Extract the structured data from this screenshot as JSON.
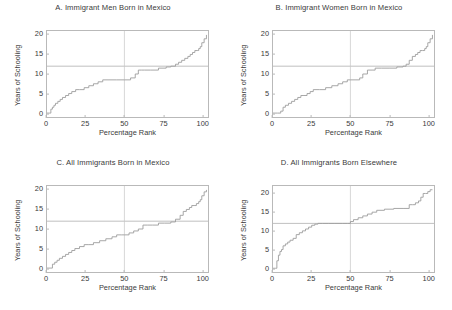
{
  "figure": {
    "background": "#ffffff",
    "line_color": "#9d9d9d",
    "axis_color": "#b9b9b9",
    "reference_line_color": "#b0b0b0"
  },
  "chart_data": [
    {
      "type": "line",
      "panel_letter": "A.",
      "title": "A.  Immigrant Men Born in Mexico",
      "xlabel": "Percentage Rank",
      "ylabel": "Years of Schooling",
      "xlim": [
        0,
        104
      ],
      "ylim": [
        -1,
        21
      ],
      "xticks": [
        0,
        25,
        50,
        75,
        100
      ],
      "yticks": [
        0,
        5,
        10,
        15,
        20
      ],
      "grid": false,
      "reference_lines": [
        {
          "orientation": "horizontal",
          "y": 12,
          "label": "12 years of schooling"
        },
        {
          "orientation": "vertical",
          "x": 50,
          "label": "median rank"
        }
      ],
      "series": [
        {
          "name": "Years of schooling by percentage rank",
          "step": "post",
          "x": [
            0,
            1.5,
            2.5,
            3.5,
            4.5,
            5.5,
            7,
            8.5,
            10,
            12,
            14,
            16,
            18.5,
            21,
            24,
            27,
            30,
            33,
            36,
            40,
            45,
            50,
            54,
            57,
            59,
            61,
            63,
            67,
            72,
            77,
            80,
            83,
            85,
            87,
            89,
            91,
            92.5,
            94,
            95.5,
            97,
            98,
            99,
            100,
            101.5,
            103
          ],
          "y": [
            0,
            0,
            1,
            1.5,
            2,
            2.5,
            3,
            3.5,
            4,
            4.5,
            5,
            5.5,
            6,
            6,
            6.5,
            7,
            7.5,
            8,
            8.5,
            8.5,
            8.5,
            8.5,
            9,
            10,
            11,
            11,
            11,
            11,
            11.5,
            11.8,
            12,
            12.5,
            13,
            13.5,
            14,
            14.5,
            15,
            15.5,
            16,
            16,
            16.5,
            17,
            18,
            19,
            20
          ]
        }
      ]
    },
    {
      "type": "line",
      "panel_letter": "B.",
      "title": "B.  Immigrant Women Born in Mexico",
      "xlabel": "Percentage Rank",
      "ylabel": "Years of Schooling",
      "xlim": [
        0,
        104
      ],
      "ylim": [
        -1,
        21
      ],
      "xticks": [
        0,
        25,
        50,
        75,
        100
      ],
      "yticks": [
        0,
        5,
        10,
        15,
        20
      ],
      "grid": false,
      "reference_lines": [
        {
          "orientation": "horizontal",
          "y": 12,
          "label": "12 years of schooling"
        },
        {
          "orientation": "vertical",
          "x": 50,
          "label": "median rank"
        }
      ],
      "series": [
        {
          "name": "Years of schooling by percentage rank",
          "step": "post",
          "x": [
            0,
            3,
            5,
            6.5,
            8,
            10,
            12,
            14,
            16,
            18,
            20,
            22,
            24,
            26,
            30,
            34,
            38,
            42,
            45,
            48,
            50,
            53,
            56,
            58,
            61,
            64,
            66,
            70,
            75,
            80,
            84,
            86,
            88,
            90,
            92,
            93.5,
            95,
            96.5,
            98,
            99,
            100,
            101.5,
            103
          ],
          "y": [
            0,
            0,
            0.5,
            1.5,
            2,
            2.5,
            3,
            3.5,
            4,
            4.5,
            4.5,
            5,
            5.5,
            6,
            6,
            6.5,
            7,
            7.5,
            8,
            8.5,
            8.5,
            8.5,
            9,
            10,
            11,
            11,
            11.5,
            11.5,
            11.5,
            11.8,
            12,
            12.5,
            13.5,
            14.5,
            15,
            15.5,
            16,
            16,
            16.5,
            17,
            18,
            19,
            20
          ]
        }
      ]
    },
    {
      "type": "line",
      "panel_letter": "C.",
      "title": "C.  All Immigrants Born in Mexico",
      "xlabel": "Percentage Rank",
      "ylabel": "Years of Schooling",
      "xlim": [
        0,
        104
      ],
      "ylim": [
        -1,
        21
      ],
      "xticks": [
        0,
        25,
        50,
        75,
        100
      ],
      "yticks": [
        0,
        5,
        10,
        15,
        20
      ],
      "grid": false,
      "reference_lines": [
        {
          "orientation": "horizontal",
          "y": 12,
          "label": "12 years of schooling"
        },
        {
          "orientation": "vertical",
          "x": 50,
          "label": "median rank"
        }
      ],
      "series": [
        {
          "name": "Years of schooling by percentage rank",
          "step": "post",
          "x": [
            0,
            2,
            3.5,
            5,
            6.5,
            8,
            10,
            12,
            14,
            16,
            18,
            21,
            24,
            27,
            30,
            34,
            38,
            42,
            45,
            48,
            50,
            53,
            56,
            59,
            62,
            65,
            68,
            72,
            76,
            80,
            83,
            86,
            88,
            90,
            92,
            93.5,
            95,
            96.5,
            98,
            99,
            100,
            101.5,
            103
          ],
          "y": [
            0,
            0,
            1,
            1.5,
            2,
            2.5,
            3,
            3.5,
            4,
            4.5,
            5,
            5.5,
            6,
            6,
            6.5,
            7,
            7.5,
            8,
            8.5,
            8.5,
            8.5,
            9,
            9.5,
            10,
            11,
            11,
            11,
            11.5,
            11.5,
            11.8,
            12.5,
            13.5,
            14.5,
            15,
            15.5,
            16,
            16,
            16.5,
            17,
            17.5,
            18.5,
            19.5,
            20
          ]
        }
      ]
    },
    {
      "type": "line",
      "panel_letter": "D.",
      "title": "D.  All Immigrants Born Elsewhere",
      "xlabel": "Percentage Rank",
      "ylabel": "Years of Schooling",
      "xlim": [
        0,
        104
      ],
      "ylim": [
        -1,
        22
      ],
      "xticks": [
        0,
        25,
        50,
        75,
        100
      ],
      "yticks": [
        0,
        5,
        10,
        15,
        20
      ],
      "grid": false,
      "reference_lines": [
        {
          "orientation": "horizontal",
          "y": 12,
          "label": "12 years of schooling"
        },
        {
          "orientation": "vertical",
          "x": 50,
          "label": "median rank"
        }
      ],
      "series": [
        {
          "name": "Years of schooling by percentage rank",
          "step": "post",
          "x": [
            0,
            1.5,
            2.5,
            3.5,
            4.5,
            5.5,
            6.5,
            8,
            9.5,
            11,
            13,
            15,
            17,
            19,
            21,
            23,
            25,
            27,
            29,
            32,
            36,
            40,
            45,
            48,
            50,
            52,
            55,
            58,
            61,
            64,
            67,
            72,
            78,
            84,
            88,
            90,
            92,
            94,
            95.5,
            97,
            98.5,
            100,
            101.5,
            103
          ],
          "y": [
            0,
            0,
            2,
            3.5,
            4.5,
            5,
            6,
            6.5,
            7,
            7.5,
            8,
            9,
            9.5,
            10,
            10.5,
            11,
            11.5,
            11.8,
            12,
            12,
            12,
            12,
            12,
            12,
            12.5,
            13,
            13.5,
            14,
            14.5,
            15,
            15.5,
            15.8,
            16,
            16,
            17,
            17,
            17.5,
            18,
            19,
            20,
            20,
            20.5,
            21,
            21
          ]
        }
      ]
    }
  ]
}
